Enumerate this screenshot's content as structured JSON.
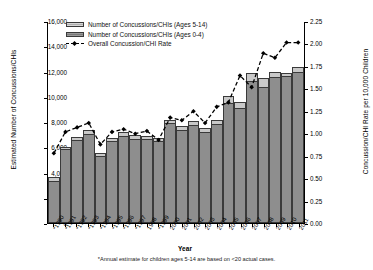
{
  "chart_data": {
    "type": "bar",
    "title": "",
    "xlabel": "Year",
    "ylabel": "Estimated Number of Concussions/CHIs",
    "y2label": "Concussion/CHI Rate per 10,000 Children",
    "ylim": [
      0,
      16000
    ],
    "y2lim": [
      0,
      2.25
    ],
    "ytick_labels": [
      "16,000",
      "14,000",
      "12,000",
      "10,000",
      "8,000",
      "6,000",
      "4,000",
      "2,000",
      "0"
    ],
    "y2tick_labels": [
      "2.25",
      "2.00",
      "1.75",
      "1.50",
      "1.25",
      "1.00",
      "0.75",
      "0.50",
      "0.25",
      "0.00"
    ],
    "grid": false,
    "legend_position": "top-left",
    "categories": [
      "*1990",
      "*1991",
      "*1992",
      "*1993",
      "*1994",
      "*1995",
      "*1996",
      "*1997",
      "1998",
      "*1999",
      "2000",
      "2001",
      "2002",
      "2003",
      "2004",
      "2005",
      "2006",
      "2007",
      "2008",
      "2009",
      "2010",
      "2011"
    ],
    "series": [
      {
        "name": "Number of Concussions/CHIs (Ages 0-4)",
        "color": "#8e8e8e",
        "axis": "left",
        "values": [
          3250,
          5750,
          6500,
          7000,
          5250,
          6450,
          6850,
          6600,
          6550,
          6450,
          7850,
          7300,
          7700,
          7100,
          7750,
          9400,
          9000,
          11150,
          10700,
          11500,
          11550,
          11900
        ]
      },
      {
        "name": "Number of Concussions/CHIs (Ages 5-14)",
        "color": "#c9c9c9",
        "axis": "left",
        "values": [
          400,
          250,
          300,
          400,
          300,
          300,
          350,
          350,
          350,
          300,
          300,
          350,
          400,
          400,
          400,
          700,
          550,
          700,
          800,
          450,
          350,
          450
        ]
      },
      {
        "name": "Overall Concussion/CHI Rate",
        "color": "#000000",
        "axis": "right",
        "type": "line",
        "values": [
          0.78,
          1.02,
          1.07,
          1.12,
          0.88,
          1.02,
          1.05,
          1.0,
          1.03,
          0.93,
          1.18,
          1.15,
          1.25,
          1.12,
          1.3,
          1.35,
          1.65,
          1.52,
          1.9,
          1.85,
          2.02,
          2.02
        ]
      }
    ],
    "footnote": "*Annual estimate for children ages 5-14 are based on <20 actual cases."
  }
}
